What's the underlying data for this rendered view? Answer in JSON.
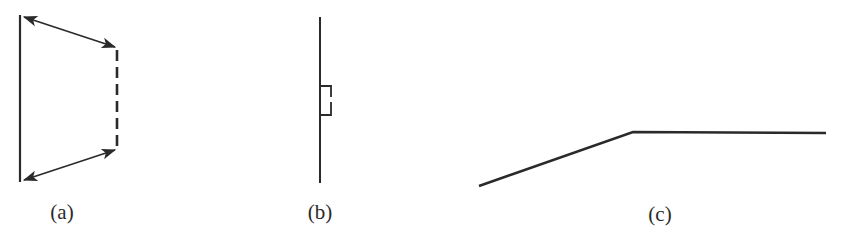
{
  "figure": {
    "colors": {
      "stroke": "#2a2a2a",
      "background": "#ffffff"
    },
    "panels": [
      {
        "id": "a",
        "label": "(a)",
        "label_pos": [
          62,
          200
        ],
        "solid_line": {
          "x1": 20,
          "y1": 15,
          "x2": 20,
          "y2": 182
        },
        "dashed_line": {
          "x1": 117,
          "y1": 50,
          "x2": 117,
          "y2": 148,
          "dashes": 6
        },
        "arrows": [
          {
            "x1": 24,
            "y1": 17,
            "x2": 115,
            "y2": 47,
            "heads": "both"
          },
          {
            "x1": 24,
            "y1": 180,
            "x2": 115,
            "y2": 150,
            "heads": "both"
          }
        ]
      },
      {
        "id": "b",
        "label": "(b)",
        "label_pos": [
          320,
          200
        ],
        "line": {
          "x1": 320,
          "y1": 17,
          "x2": 320,
          "y2": 183
        },
        "bracket": {
          "x": 320,
          "y_top": 86,
          "y_bottom": 115,
          "width": 11,
          "gap_top": 97,
          "gap_bottom": 102
        }
      },
      {
        "id": "c",
        "label": "(c)",
        "label_pos": [
          660,
          202
        ],
        "polyline": [
          [
            479,
            186
          ],
          [
            633,
            132
          ],
          [
            826,
            133
          ]
        ]
      }
    ]
  }
}
